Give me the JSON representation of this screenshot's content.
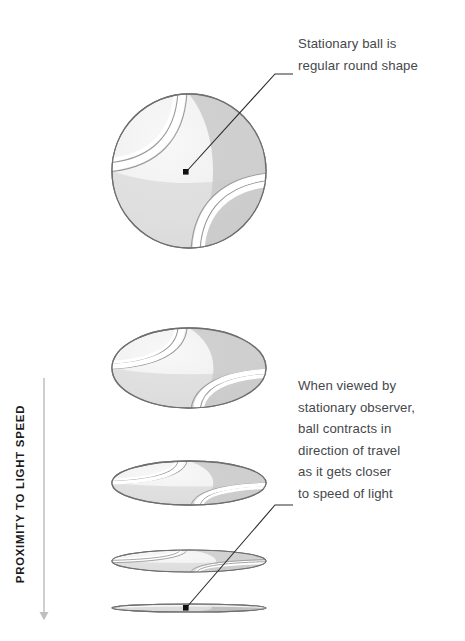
{
  "figure": {
    "title_alt": "Relativistic length contraction of a ball approaching light speed",
    "axis_label": "PROXIMITY TO LIGHT SPEED",
    "annotations": {
      "top": "Stationary ball is\nregular round shape",
      "bottom": "When viewed by\nstationary observer,\nball contracts in\ndirection of travel\nas it gets closer\nto speed of light"
    },
    "colors": {
      "background": "#ffffff",
      "ball_fill": "#f1f1f1",
      "ball_fill_light": "#f7f7f7",
      "ball_shade": "#c9c9c9",
      "ball_outline": "#6e6e6e",
      "seam_outline": "#9b9b9b",
      "seam_fill": "#ffffff",
      "leader_line": "#2c2c2c",
      "text": "#45484b",
      "axis_text": "#1b1b1b",
      "arrow": "#bfbfbf"
    },
    "shapes": [
      {
        "name": "ball-round",
        "cx": 189,
        "cy": 171,
        "rx": 77,
        "ry": 77,
        "label": "stationary round ball"
      },
      {
        "name": "ball-ellipse-1",
        "cx": 189,
        "cy": 368,
        "rx": 77,
        "ry": 40,
        "label": "slightly contracted ball"
      },
      {
        "name": "ball-ellipse-2",
        "cx": 189,
        "cy": 483,
        "rx": 77,
        "ry": 22,
        "label": "more contracted ball"
      },
      {
        "name": "ball-ellipse-3",
        "cx": 189,
        "cy": 561,
        "rx": 77,
        "ry": 11,
        "label": "strongly contracted ball"
      },
      {
        "name": "ball-ellipse-4",
        "cx": 189,
        "cy": 608,
        "rx": 77,
        "ry": 4,
        "label": "almost flat ball"
      }
    ],
    "leaders": [
      {
        "name": "leader-top",
        "dot_x": 186,
        "dot_y": 172,
        "bend_x": 275,
        "bend_y": 74,
        "end_x": 293,
        "end_y": 74
      },
      {
        "name": "leader-bottom",
        "dot_x": 186,
        "dot_y": 608,
        "bend_x": 275,
        "bend_y": 505,
        "end_x": 293,
        "end_y": 505
      }
    ],
    "arrow": {
      "name": "proximity-arrow",
      "x": 44,
      "y_start": 378,
      "y_end": 620
    }
  }
}
